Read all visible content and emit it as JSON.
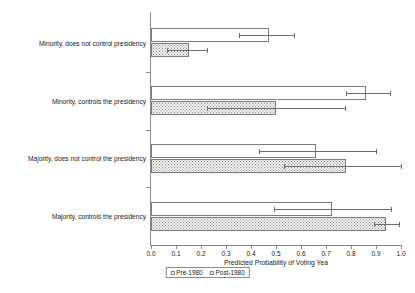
{
  "chart_data": {
    "type": "bar",
    "orientation": "horizontal",
    "title": "",
    "xlabel": "Predicted Probability of Voting Yea",
    "ylabel": "",
    "xlim": [
      0.0,
      1.0
    ],
    "xticks": [
      "0.0",
      "0.1",
      "0.2",
      "0.3",
      "0.4",
      "0.5",
      "0.6",
      "0.7",
      "0.8",
      "0.9",
      "1.0"
    ],
    "xtick_values": [
      0.0,
      0.1,
      0.2,
      0.3,
      0.4,
      0.5,
      0.6,
      0.7,
      0.8,
      0.9,
      1.0
    ],
    "grid": false,
    "legend_position": "below-axis-center",
    "categories": [
      "Minority, does not control presidency",
      "Minority, controls the presidency",
      "Majority, does not control the presidency",
      "Majority, controls the presidency"
    ],
    "series": [
      {
        "name": "Pre-1980",
        "fill": "white",
        "values": [
          0.47,
          0.86,
          0.66,
          0.725
        ],
        "error_low": [
          0.35,
          0.78,
          0.43,
          0.49
        ],
        "error_high": [
          0.57,
          0.955,
          0.9,
          0.96
        ]
      },
      {
        "name": "Post-1980",
        "fill": "dotted-gray",
        "values": [
          0.15,
          0.5,
          0.78,
          0.94
        ],
        "error_low": [
          0.065,
          0.225,
          0.53,
          0.89
        ],
        "error_high": [
          0.225,
          0.775,
          1.0,
          0.99
        ]
      }
    ]
  },
  "legend": {
    "items": [
      {
        "label": "Pre-1980",
        "swatch": "white-square"
      },
      {
        "label": "Post-1980",
        "swatch": "dotted-square"
      }
    ]
  },
  "colors": {
    "axis": "#8a8a8a",
    "bar_border": "#7d7d7d",
    "bar_pre_fill": "#ffffff",
    "bar_post_fill": "#f2f2f0",
    "error_bar": "#6e6e6e",
    "text": "#1a1a1a"
  }
}
